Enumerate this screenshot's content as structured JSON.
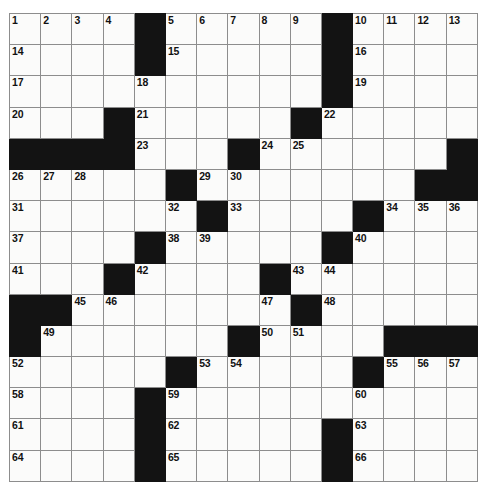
{
  "puzzle": {
    "type": "crossword-grid",
    "rows": 15,
    "cols": 15,
    "cell_size_px": 31.2,
    "colors": {
      "block": "#131313",
      "cell": "#fbfbfa",
      "grid_line": "#8d8d8d",
      "border": "#2b2b2b",
      "number_text": "#111111"
    },
    "grid": [
      [
        {
          "block": false,
          "num": "1"
        },
        {
          "block": false,
          "num": "2"
        },
        {
          "block": false,
          "num": "3"
        },
        {
          "block": false,
          "num": "4"
        },
        {
          "block": true,
          "num": ""
        },
        {
          "block": false,
          "num": "5"
        },
        {
          "block": false,
          "num": "6"
        },
        {
          "block": false,
          "num": "7"
        },
        {
          "block": false,
          "num": "8"
        },
        {
          "block": false,
          "num": "9"
        },
        {
          "block": true,
          "num": ""
        },
        {
          "block": false,
          "num": "10"
        },
        {
          "block": false,
          "num": "11"
        },
        {
          "block": false,
          "num": "12"
        },
        {
          "block": false,
          "num": "13"
        }
      ],
      [
        {
          "block": false,
          "num": "14"
        },
        {
          "block": false,
          "num": ""
        },
        {
          "block": false,
          "num": ""
        },
        {
          "block": false,
          "num": ""
        },
        {
          "block": true,
          "num": ""
        },
        {
          "block": false,
          "num": "15"
        },
        {
          "block": false,
          "num": ""
        },
        {
          "block": false,
          "num": ""
        },
        {
          "block": false,
          "num": ""
        },
        {
          "block": false,
          "num": ""
        },
        {
          "block": true,
          "num": ""
        },
        {
          "block": false,
          "num": "16"
        },
        {
          "block": false,
          "num": ""
        },
        {
          "block": false,
          "num": ""
        },
        {
          "block": false,
          "num": ""
        }
      ],
      [
        {
          "block": false,
          "num": "17"
        },
        {
          "block": false,
          "num": ""
        },
        {
          "block": false,
          "num": ""
        },
        {
          "block": false,
          "num": ""
        },
        {
          "block": false,
          "num": "18"
        },
        {
          "block": false,
          "num": ""
        },
        {
          "block": false,
          "num": ""
        },
        {
          "block": false,
          "num": ""
        },
        {
          "block": false,
          "num": ""
        },
        {
          "block": false,
          "num": ""
        },
        {
          "block": true,
          "num": ""
        },
        {
          "block": false,
          "num": "19"
        },
        {
          "block": false,
          "num": ""
        },
        {
          "block": false,
          "num": ""
        },
        {
          "block": false,
          "num": ""
        }
      ],
      [
        {
          "block": false,
          "num": "20"
        },
        {
          "block": false,
          "num": ""
        },
        {
          "block": false,
          "num": ""
        },
        {
          "block": true,
          "num": ""
        },
        {
          "block": false,
          "num": "21"
        },
        {
          "block": false,
          "num": ""
        },
        {
          "block": false,
          "num": ""
        },
        {
          "block": false,
          "num": ""
        },
        {
          "block": false,
          "num": ""
        },
        {
          "block": true,
          "num": ""
        },
        {
          "block": false,
          "num": "22"
        },
        {
          "block": false,
          "num": ""
        },
        {
          "block": false,
          "num": ""
        },
        {
          "block": false,
          "num": ""
        },
        {
          "block": false,
          "num": ""
        }
      ],
      [
        {
          "block": true,
          "num": ""
        },
        {
          "block": true,
          "num": ""
        },
        {
          "block": true,
          "num": ""
        },
        {
          "block": true,
          "num": ""
        },
        {
          "block": false,
          "num": "23"
        },
        {
          "block": false,
          "num": ""
        },
        {
          "block": false,
          "num": ""
        },
        {
          "block": true,
          "num": ""
        },
        {
          "block": false,
          "num": "24"
        },
        {
          "block": false,
          "num": "25"
        },
        {
          "block": false,
          "num": ""
        },
        {
          "block": false,
          "num": ""
        },
        {
          "block": false,
          "num": ""
        },
        {
          "block": false,
          "num": ""
        },
        {
          "block": true,
          "num": ""
        }
      ],
      [
        {
          "block": false,
          "num": "26"
        },
        {
          "block": false,
          "num": "27"
        },
        {
          "block": false,
          "num": "28"
        },
        {
          "block": false,
          "num": ""
        },
        {
          "block": false,
          "num": ""
        },
        {
          "block": true,
          "num": ""
        },
        {
          "block": false,
          "num": "29"
        },
        {
          "block": false,
          "num": "30"
        },
        {
          "block": false,
          "num": ""
        },
        {
          "block": false,
          "num": ""
        },
        {
          "block": false,
          "num": ""
        },
        {
          "block": false,
          "num": ""
        },
        {
          "block": false,
          "num": ""
        },
        {
          "block": true,
          "num": ""
        },
        {
          "block": true,
          "num": ""
        }
      ],
      [
        {
          "block": false,
          "num": "31"
        },
        {
          "block": false,
          "num": ""
        },
        {
          "block": false,
          "num": ""
        },
        {
          "block": false,
          "num": ""
        },
        {
          "block": false,
          "num": ""
        },
        {
          "block": false,
          "num": "32"
        },
        {
          "block": true,
          "num": ""
        },
        {
          "block": false,
          "num": "33"
        },
        {
          "block": false,
          "num": ""
        },
        {
          "block": false,
          "num": ""
        },
        {
          "block": false,
          "num": ""
        },
        {
          "block": true,
          "num": ""
        },
        {
          "block": false,
          "num": "34"
        },
        {
          "block": false,
          "num": "35"
        },
        {
          "block": false,
          "num": "36"
        }
      ],
      [
        {
          "block": false,
          "num": "37"
        },
        {
          "block": false,
          "num": ""
        },
        {
          "block": false,
          "num": ""
        },
        {
          "block": false,
          "num": ""
        },
        {
          "block": true,
          "num": ""
        },
        {
          "block": false,
          "num": "38"
        },
        {
          "block": false,
          "num": "39"
        },
        {
          "block": false,
          "num": ""
        },
        {
          "block": false,
          "num": ""
        },
        {
          "block": false,
          "num": ""
        },
        {
          "block": true,
          "num": ""
        },
        {
          "block": false,
          "num": "40"
        },
        {
          "block": false,
          "num": ""
        },
        {
          "block": false,
          "num": ""
        },
        {
          "block": false,
          "num": ""
        }
      ],
      [
        {
          "block": false,
          "num": "41"
        },
        {
          "block": false,
          "num": ""
        },
        {
          "block": false,
          "num": ""
        },
        {
          "block": true,
          "num": ""
        },
        {
          "block": false,
          "num": "42"
        },
        {
          "block": false,
          "num": ""
        },
        {
          "block": false,
          "num": ""
        },
        {
          "block": false,
          "num": ""
        },
        {
          "block": true,
          "num": ""
        },
        {
          "block": false,
          "num": "43"
        },
        {
          "block": false,
          "num": "44"
        },
        {
          "block": false,
          "num": ""
        },
        {
          "block": false,
          "num": ""
        },
        {
          "block": false,
          "num": ""
        },
        {
          "block": false,
          "num": ""
        }
      ],
      [
        {
          "block": true,
          "num": ""
        },
        {
          "block": true,
          "num": ""
        },
        {
          "block": false,
          "num": "45"
        },
        {
          "block": false,
          "num": "46"
        },
        {
          "block": false,
          "num": ""
        },
        {
          "block": false,
          "num": ""
        },
        {
          "block": false,
          "num": ""
        },
        {
          "block": false,
          "num": ""
        },
        {
          "block": false,
          "num": "47"
        },
        {
          "block": true,
          "num": ""
        },
        {
          "block": false,
          "num": "48"
        },
        {
          "block": false,
          "num": ""
        },
        {
          "block": false,
          "num": ""
        },
        {
          "block": false,
          "num": ""
        },
        {
          "block": false,
          "num": ""
        }
      ],
      [
        {
          "block": true,
          "num": ""
        },
        {
          "block": false,
          "num": "49"
        },
        {
          "block": false,
          "num": ""
        },
        {
          "block": false,
          "num": ""
        },
        {
          "block": false,
          "num": ""
        },
        {
          "block": false,
          "num": ""
        },
        {
          "block": false,
          "num": ""
        },
        {
          "block": true,
          "num": ""
        },
        {
          "block": false,
          "num": "50"
        },
        {
          "block": false,
          "num": "51"
        },
        {
          "block": false,
          "num": ""
        },
        {
          "block": false,
          "num": ""
        },
        {
          "block": true,
          "num": ""
        },
        {
          "block": true,
          "num": ""
        },
        {
          "block": true,
          "num": ""
        }
      ],
      [
        {
          "block": false,
          "num": "52"
        },
        {
          "block": false,
          "num": ""
        },
        {
          "block": false,
          "num": ""
        },
        {
          "block": false,
          "num": ""
        },
        {
          "block": false,
          "num": ""
        },
        {
          "block": true,
          "num": ""
        },
        {
          "block": false,
          "num": "53"
        },
        {
          "block": false,
          "num": "54"
        },
        {
          "block": false,
          "num": ""
        },
        {
          "block": false,
          "num": ""
        },
        {
          "block": false,
          "num": ""
        },
        {
          "block": true,
          "num": ""
        },
        {
          "block": false,
          "num": "55"
        },
        {
          "block": false,
          "num": "56"
        },
        {
          "block": false,
          "num": "57"
        }
      ],
      [
        {
          "block": false,
          "num": "58"
        },
        {
          "block": false,
          "num": ""
        },
        {
          "block": false,
          "num": ""
        },
        {
          "block": false,
          "num": ""
        },
        {
          "block": true,
          "num": ""
        },
        {
          "block": false,
          "num": "59"
        },
        {
          "block": false,
          "num": ""
        },
        {
          "block": false,
          "num": ""
        },
        {
          "block": false,
          "num": ""
        },
        {
          "block": false,
          "num": ""
        },
        {
          "block": false,
          "num": ""
        },
        {
          "block": false,
          "num": "60"
        },
        {
          "block": false,
          "num": ""
        },
        {
          "block": false,
          "num": ""
        },
        {
          "block": false,
          "num": ""
        }
      ],
      [
        {
          "block": false,
          "num": "61"
        },
        {
          "block": false,
          "num": ""
        },
        {
          "block": false,
          "num": ""
        },
        {
          "block": false,
          "num": ""
        },
        {
          "block": true,
          "num": ""
        },
        {
          "block": false,
          "num": "62"
        },
        {
          "block": false,
          "num": ""
        },
        {
          "block": false,
          "num": ""
        },
        {
          "block": false,
          "num": ""
        },
        {
          "block": false,
          "num": ""
        },
        {
          "block": true,
          "num": ""
        },
        {
          "block": false,
          "num": "63"
        },
        {
          "block": false,
          "num": ""
        },
        {
          "block": false,
          "num": ""
        },
        {
          "block": false,
          "num": ""
        }
      ],
      [
        {
          "block": false,
          "num": "64"
        },
        {
          "block": false,
          "num": ""
        },
        {
          "block": false,
          "num": ""
        },
        {
          "block": false,
          "num": ""
        },
        {
          "block": true,
          "num": ""
        },
        {
          "block": false,
          "num": "65"
        },
        {
          "block": false,
          "num": ""
        },
        {
          "block": false,
          "num": ""
        },
        {
          "block": false,
          "num": ""
        },
        {
          "block": false,
          "num": ""
        },
        {
          "block": true,
          "num": ""
        },
        {
          "block": false,
          "num": "66"
        },
        {
          "block": false,
          "num": ""
        },
        {
          "block": false,
          "num": ""
        },
        {
          "block": false,
          "num": ""
        }
      ]
    ]
  }
}
